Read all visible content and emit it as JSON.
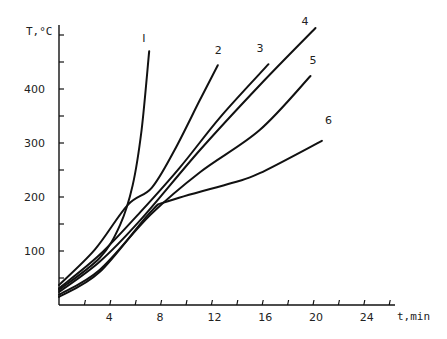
{
  "chart_data": {
    "type": "line",
    "title": "",
    "xlabel": "t,min",
    "ylabel": "T,°C",
    "xlim": [
      0,
      26
    ],
    "ylim": [
      0,
      500
    ],
    "x_ticks": [
      "4",
      "8",
      "12",
      "16",
      "20",
      "24"
    ],
    "y_ticks": [
      "100",
      "200",
      "300",
      "400"
    ],
    "grid": false,
    "legend": "inline curve labels",
    "series": [
      {
        "name": "I",
        "x": [
          0,
          3.2,
          4.8,
          5.8,
          6.5,
          7.1
        ],
        "y": [
          28,
          87,
          148,
          222,
          324,
          470
        ]
      },
      {
        "name": "2",
        "x": [
          0,
          2.8,
          5.4,
          7.3,
          9.1,
          11.1,
          12.5
        ],
        "y": [
          37,
          102,
          185,
          217,
          287,
          380,
          444
        ]
      },
      {
        "name": "3",
        "x": [
          0,
          3.2,
          6.4,
          9.5,
          12.7,
          16.5
        ],
        "y": [
          31,
          93,
          172,
          254,
          348,
          446
        ]
      },
      {
        "name": "4",
        "x": [
          0,
          3.2,
          6.4,
          11.1,
          15.8,
          20.2
        ],
        "y": [
          24,
          80,
          157,
          287,
          407,
          513
        ]
      },
      {
        "name": "5",
        "x": [
          0,
          3.2,
          7.2,
          11.1,
          15.8,
          19.8
        ],
        "y": [
          19,
          65,
          167,
          246,
          324,
          424
        ]
      },
      {
        "name": "6",
        "x": [
          0,
          3.2,
          7.2,
          8.7,
          13.6,
          15.8,
          20.7
        ],
        "y": [
          15,
          61,
          172,
          193,
          226,
          244,
          304
        ]
      }
    ]
  },
  "labels": {
    "y_axis": "T,°C",
    "x_axis": "t,min",
    "curves": [
      "I",
      "2",
      "3",
      "4",
      "5",
      "6"
    ]
  }
}
